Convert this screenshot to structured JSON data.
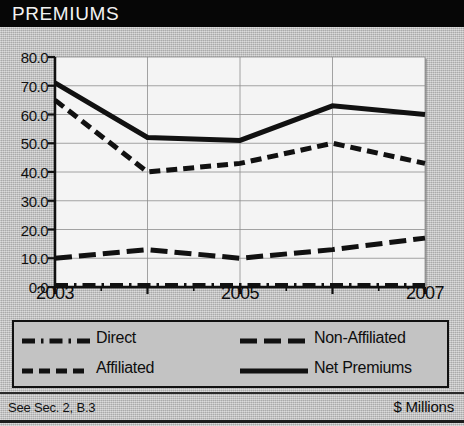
{
  "header": {
    "title": "PREMIUMS"
  },
  "footer": {
    "left": "See Sec. 2, B.3",
    "right": "$ Millions"
  },
  "chart_data": {
    "type": "line",
    "title": "PREMIUMS",
    "xlabel": "",
    "ylabel": "$ Millions",
    "units": "$ Millions",
    "x": [
      2003,
      2004,
      2005,
      2006,
      2007
    ],
    "xtick_labels": [
      "2003",
      "",
      "2005",
      "",
      "2007"
    ],
    "xlim": [
      2003,
      2007
    ],
    "ylim": [
      0.0,
      80.0
    ],
    "ytick_labels": [
      "0.0",
      "10.0",
      "20.0",
      "30.0",
      "40.0",
      "50.0",
      "60.0",
      "70.0",
      "80.0"
    ],
    "ytick_values": [
      0.0,
      10.0,
      20.0,
      30.0,
      40.0,
      50.0,
      60.0,
      70.0,
      80.0
    ],
    "grid": true,
    "legend_position": "below-plot",
    "series": [
      {
        "name": "Direct",
        "style": "dash-dot",
        "values": [
          0.5,
          0.5,
          0.5,
          0.5,
          0.5
        ]
      },
      {
        "name": "Affiliated",
        "style": "dashed",
        "values": [
          65.0,
          40.0,
          43.0,
          50.0,
          43.0
        ]
      },
      {
        "name": "Non-Affiliated",
        "style": "long-dash",
        "values": [
          10.0,
          13.0,
          10.0,
          13.0,
          17.0
        ]
      },
      {
        "name": "Net Premiums",
        "style": "solid",
        "values": [
          71.0,
          52.0,
          51.0,
          63.0,
          60.0
        ]
      }
    ]
  },
  "legend": {
    "items": [
      {
        "label": "Direct",
        "style": "dash-dot"
      },
      {
        "label": "Affiliated",
        "style": "dashed"
      },
      {
        "label": "Non-Affiliated",
        "style": "long-dash"
      },
      {
        "label": "Net Premiums",
        "style": "solid"
      }
    ]
  },
  "colors": {
    "line": "#111111",
    "plot_bg": "#f4f4f4",
    "card_bg": "#bcbcbc",
    "title_bg": "#060606",
    "title_fg": "#f2f2f2",
    "grid": "#8d8d8d"
  }
}
